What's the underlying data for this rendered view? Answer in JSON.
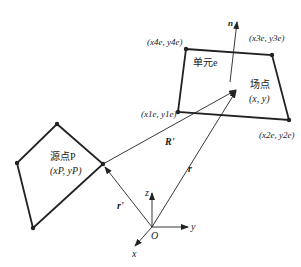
{
  "diagram": {
    "labels": {
      "element": "单元e",
      "field_point": "场点",
      "field_coords": "(x, y)",
      "source_point": "源点P",
      "source_coords": "(xP, yP)",
      "normal": "n",
      "R_prime": "R'",
      "r": "r",
      "r_prime": "r'",
      "node1": "(x1e, y1e)",
      "node2": "(x2e, y2e)",
      "node3": "(x3e, y3e)",
      "node4": "(x4e, y4e)",
      "axis_z": "z",
      "axis_y": "y",
      "axis_x": "x",
      "origin": "O"
    },
    "colors": {
      "line": "#222222",
      "background": "#ffffff"
    }
  }
}
